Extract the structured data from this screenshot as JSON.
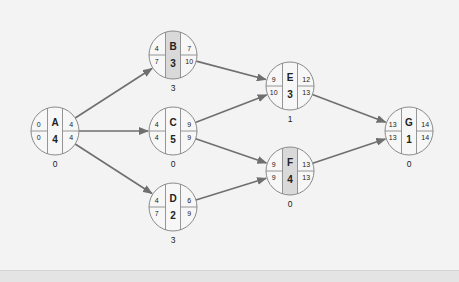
{
  "diagram": {
    "type": "activity-on-node network",
    "colors": {
      "background": "#f3f3f3",
      "node_fill": "#f7f7f7",
      "node_stroke": "#8a8a8a",
      "highlight_strip": "#d9d9d9",
      "arrow": "#6f6f6f",
      "text": "#222222"
    },
    "nodes": [
      {
        "id": "A",
        "es": "0",
        "ls": "0",
        "ef": "4",
        "lf": "4",
        "duration": "4",
        "slack": "0",
        "cx": 55,
        "cy": 131,
        "highlight": false
      },
      {
        "id": "B",
        "es": "4",
        "ls": "7",
        "ef": "7",
        "lf": "10",
        "duration": "3",
        "slack": "3",
        "cx": 173,
        "cy": 55,
        "highlight": true
      },
      {
        "id": "C",
        "es": "4",
        "ls": "4",
        "ef": "9",
        "lf": "9",
        "duration": "5",
        "slack": "0",
        "cx": 173,
        "cy": 131,
        "highlight": false
      },
      {
        "id": "D",
        "es": "4",
        "ls": "7",
        "ef": "6",
        "lf": "9",
        "duration": "2",
        "slack": "3",
        "cx": 173,
        "cy": 207,
        "highlight": false
      },
      {
        "id": "E",
        "es": "9",
        "ls": "10",
        "ef": "12",
        "lf": "13",
        "duration": "3",
        "slack": "1",
        "cx": 290,
        "cy": 86,
        "highlight": false
      },
      {
        "id": "F",
        "es": "9",
        "ls": "9",
        "ef": "13",
        "lf": "13",
        "duration": "4",
        "slack": "0",
        "cx": 290,
        "cy": 171,
        "highlight": true
      },
      {
        "id": "G",
        "es": "13",
        "ls": "13",
        "ef": "14",
        "lf": "14",
        "duration": "1",
        "slack": "0",
        "cx": 409,
        "cy": 131,
        "highlight": false
      }
    ],
    "edges": [
      {
        "from": "A",
        "to": "B"
      },
      {
        "from": "A",
        "to": "C"
      },
      {
        "from": "A",
        "to": "D"
      },
      {
        "from": "B",
        "to": "E"
      },
      {
        "from": "C",
        "to": "E"
      },
      {
        "from": "C",
        "to": "F"
      },
      {
        "from": "D",
        "to": "F"
      },
      {
        "from": "E",
        "to": "G"
      },
      {
        "from": "F",
        "to": "G"
      }
    ]
  }
}
